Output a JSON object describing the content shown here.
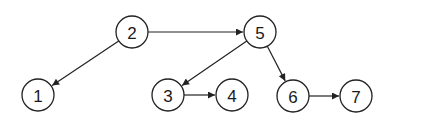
{
  "diagram": {
    "type": "directed-graph",
    "node_radius": 16,
    "stroke_color": "#222222",
    "background": "#ffffff",
    "nodes": [
      {
        "id": "1",
        "label": "1",
        "x": 38,
        "y": 95
      },
      {
        "id": "2",
        "label": "2",
        "x": 132,
        "y": 32
      },
      {
        "id": "3",
        "label": "3",
        "x": 168,
        "y": 95
      },
      {
        "id": "4",
        "label": "4",
        "x": 232,
        "y": 95
      },
      {
        "id": "5",
        "label": "5",
        "x": 260,
        "y": 32
      },
      {
        "id": "6",
        "label": "6",
        "x": 293,
        "y": 96
      },
      {
        "id": "7",
        "label": "7",
        "x": 356,
        "y": 96
      }
    ],
    "edges": [
      {
        "from": "2",
        "to": "1"
      },
      {
        "from": "2",
        "to": "5"
      },
      {
        "from": "5",
        "to": "3"
      },
      {
        "from": "5",
        "to": "6"
      },
      {
        "from": "3",
        "to": "4"
      },
      {
        "from": "6",
        "to": "7"
      }
    ]
  }
}
